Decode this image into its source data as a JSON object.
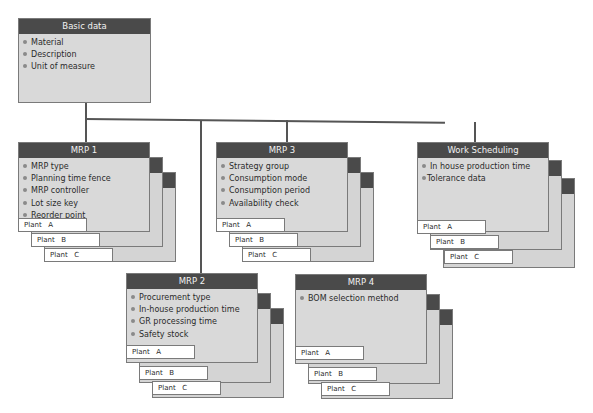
{
  "diagram": {
    "basic_data": {
      "title": "Basic data",
      "items": [
        "Material",
        "Description",
        "Unit of measure"
      ]
    },
    "views": [
      {
        "id": "mrp1",
        "title": "MRP 1",
        "items": [
          "MRP type",
          "Planning time fence",
          "MRP controller",
          "Lot size key",
          "Reorder point"
        ],
        "plants": [
          "Plant   A",
          "Plant   B",
          "Plant   C"
        ]
      },
      {
        "id": "mrp3",
        "title": "MRP 3",
        "items": [
          "Strategy group",
          "Consumption mode",
          "Consumption period",
          "Availability check"
        ],
        "plants": [
          "Plant   A",
          "Plant   B",
          "Plant   C"
        ]
      },
      {
        "id": "work_scheduling",
        "title": "Work Scheduling",
        "items": [
          "In house production time",
          "Tolerance data"
        ],
        "plants": [
          "Plant   A",
          "Plant   B",
          "Plant   C"
        ]
      },
      {
        "id": "mrp2",
        "title": "MRP 2",
        "items": [
          "Procurement type",
          "In-house production time",
          "GR processing time",
          "Safety stock"
        ],
        "plants": [
          "Plant   A",
          "Plant   B",
          "Plant   C"
        ]
      },
      {
        "id": "mrp4",
        "title": "MRP 4",
        "items": [
          "BOM selection method"
        ],
        "plants": [
          "Plant   A",
          "Plant   B",
          "Plant   C"
        ]
      }
    ],
    "colors": {
      "header": "#4a4a4a",
      "box_fill": "#d9d9d9",
      "plant_tab": "#ffffff",
      "connector": "#555555"
    }
  }
}
